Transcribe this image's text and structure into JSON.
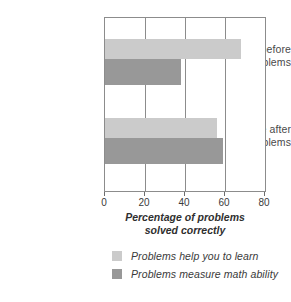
{
  "chart_data": {
    "type": "bar",
    "orientation": "horizontal",
    "title": "",
    "subtitle": "",
    "xlabel_line1": "Percentage of problems",
    "xlabel_line2": "solved correctly",
    "ylabel": "",
    "categories": [
      {
        "line1": "List race before",
        "line2": "solving problems"
      },
      {
        "line1": "List race after",
        "line2": "solving problems"
      }
    ],
    "series": [
      {
        "name": "Problems help you to learn",
        "color": "#cbcbcb",
        "values": [
          68,
          56
        ]
      },
      {
        "name": "Problems measure math ability",
        "color": "#989898",
        "values": [
          38,
          59
        ]
      }
    ],
    "xlim": [
      0,
      80
    ],
    "xticks": [
      0,
      20,
      40,
      60,
      80
    ],
    "xtick_labels": [
      "0",
      "20",
      "40",
      "60",
      "80"
    ],
    "grid": true,
    "grid_axis": "x",
    "legend_position": "bottom"
  },
  "legend": {
    "items": [
      {
        "label": "Problems help you to learn",
        "color": "#cbcbcb"
      },
      {
        "label": "Problems measure math ability",
        "color": "#989898"
      }
    ]
  },
  "colors": {
    "series_light": "#cbcbcb",
    "series_dark": "#989898",
    "axis": "#8c8c8c",
    "text": "#3a3a3a",
    "background": "#ffffff"
  }
}
